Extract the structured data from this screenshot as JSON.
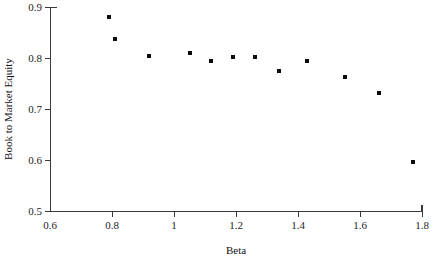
{
  "chart_data": {
    "type": "scatter",
    "title": "",
    "xlabel": "Beta",
    "ylabel": "Book to Market Equity",
    "xlim": [
      0.6,
      1.8
    ],
    "ylim": [
      0.5,
      0.9
    ],
    "grid": false,
    "legend": null,
    "xticks": [
      "0.6",
      "0.8",
      "1",
      "1.2",
      "1.4",
      "1.6",
      "1.8"
    ],
    "xtick_values": [
      0.6,
      0.8,
      1.0,
      1.2,
      1.4,
      1.6,
      1.8
    ],
    "yticks": [
      "0.5",
      "0.6",
      "0.7",
      "0.8",
      "0.9"
    ],
    "ytick_values": [
      0.5,
      0.6,
      0.7,
      0.8,
      0.9
    ],
    "marker": "square",
    "marker_color": "#0a0a0a",
    "marker_size": 4,
    "x": [
      0.79,
      0.81,
      0.92,
      1.05,
      1.12,
      1.19,
      1.26,
      1.34,
      1.43,
      1.55,
      1.66,
      1.77
    ],
    "y": [
      0.88,
      0.837,
      0.804,
      0.81,
      0.794,
      0.802,
      0.802,
      0.775,
      0.794,
      0.763,
      0.731,
      0.596
    ],
    "points": [
      {
        "x": 0.79,
        "y": 0.88
      },
      {
        "x": 0.81,
        "y": 0.837
      },
      {
        "x": 0.92,
        "y": 0.804
      },
      {
        "x": 1.05,
        "y": 0.81
      },
      {
        "x": 1.12,
        "y": 0.794
      },
      {
        "x": 1.19,
        "y": 0.802
      },
      {
        "x": 1.26,
        "y": 0.802
      },
      {
        "x": 1.34,
        "y": 0.775
      },
      {
        "x": 1.43,
        "y": 0.794
      },
      {
        "x": 1.55,
        "y": 0.763
      },
      {
        "x": 1.66,
        "y": 0.731
      },
      {
        "x": 1.77,
        "y": 0.596
      }
    ]
  }
}
